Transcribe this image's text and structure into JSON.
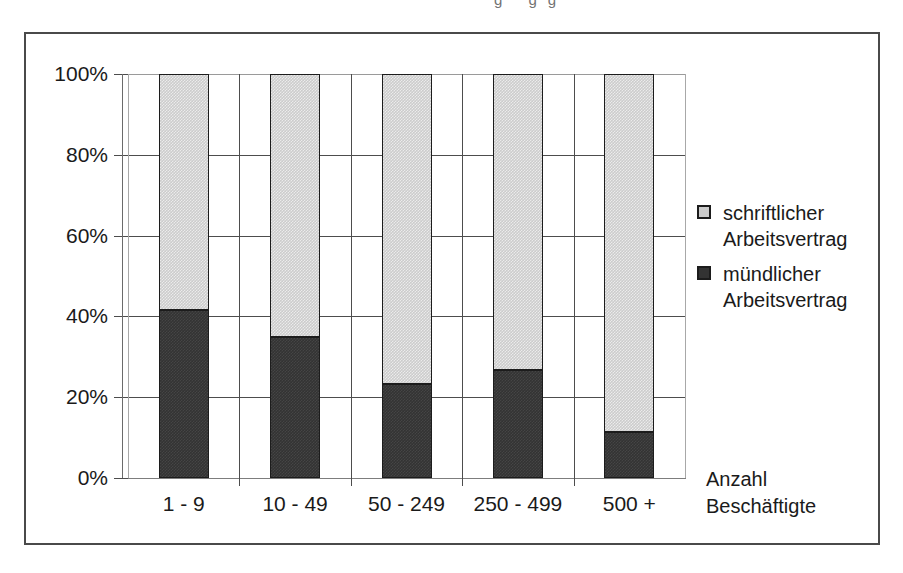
{
  "top_artifact": "g gg",
  "chart_data": {
    "type": "bar",
    "subtype": "stacked-100-percent",
    "title": "",
    "xlabel_lines": [
      "Anzahl",
      "Beschäftigte"
    ],
    "ylabel": "",
    "categories": [
      "1 - 9",
      "10 - 49",
      "50 - 249",
      "250 - 499",
      "500 +"
    ],
    "ytick_labels": [
      "100%",
      "80%",
      "60%",
      "40%",
      "20%",
      "0%"
    ],
    "ytick_values": [
      100,
      80,
      60,
      40,
      20,
      0
    ],
    "ylim": [
      0,
      100
    ],
    "grid": true,
    "legend_position": "right",
    "series": [
      {
        "name": "schriftlicher Arbeitsvertrag",
        "name_lines": [
          "schriftlicher",
          "Arbeitsvertrag"
        ],
        "color": "#cccccc",
        "values": [
          58.5,
          65.0,
          76.8,
          73.2,
          88.6
        ]
      },
      {
        "name": "mündlicher Arbeitsvertrag",
        "name_lines": [
          "mündlicher",
          "Arbeitsvertrag"
        ],
        "color": "#333333",
        "values": [
          41.5,
          35.0,
          23.2,
          26.8,
          11.4
        ]
      }
    ]
  },
  "colors": {
    "light_fill": "#cccccc",
    "dark_fill": "#333333",
    "outline": "#1c1c1c",
    "grid": "#4d4d4d",
    "frame": "#4a4a4a"
  }
}
